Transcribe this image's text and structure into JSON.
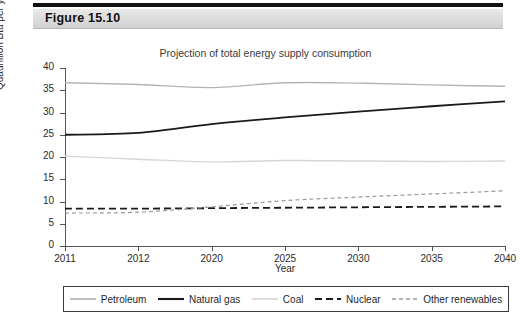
{
  "figure": {
    "label": "Figure 15.10"
  },
  "chart_data": {
    "type": "line",
    "title": "Projection of total energy supply consumption",
    "xlabel": "Year",
    "ylabel": "Quadrillion Btu per year",
    "categories": [
      "2011",
      "2012",
      "2020",
      "2025",
      "2030",
      "2035",
      "2040"
    ],
    "xticklabels": [
      "2011",
      "2012",
      "2020",
      "2025",
      "2030",
      "2035",
      "2040"
    ],
    "yticklabels": [
      "0",
      "5",
      "10",
      "15",
      "20",
      "25",
      "30",
      "35",
      "40"
    ],
    "ylim": [
      0,
      40
    ],
    "ytick_step": 5,
    "grid": false,
    "legend_position": "bottom",
    "series": [
      {
        "name": "Petroleum",
        "color": "#b4b4b4",
        "style": "solid",
        "width": 1.4,
        "values": [
          36.7,
          36.3,
          35.6,
          36.7,
          36.6,
          36.2,
          35.9
        ]
      },
      {
        "name": "Natural gas",
        "color": "#1a1a1a",
        "style": "solid",
        "width": 1.8,
        "values": [
          25.0,
          25.4,
          27.4,
          28.9,
          30.2,
          31.4,
          32.5
        ]
      },
      {
        "name": "Coal",
        "color": "#d6d6d6",
        "style": "solid",
        "width": 1.4,
        "values": [
          20.2,
          19.5,
          18.9,
          19.2,
          19.1,
          19.0,
          19.1
        ]
      },
      {
        "name": "Nuclear",
        "color": "#1a1a1a",
        "style": "dashed",
        "width": 1.8,
        "values": [
          8.4,
          8.4,
          8.5,
          8.6,
          8.7,
          8.8,
          8.9
        ]
      },
      {
        "name": "Other renewables",
        "color": "#9a9a9a",
        "style": "dashed",
        "width": 1.2,
        "values": [
          7.4,
          7.6,
          8.8,
          10.2,
          11.0,
          11.7,
          12.4
        ]
      }
    ]
  }
}
